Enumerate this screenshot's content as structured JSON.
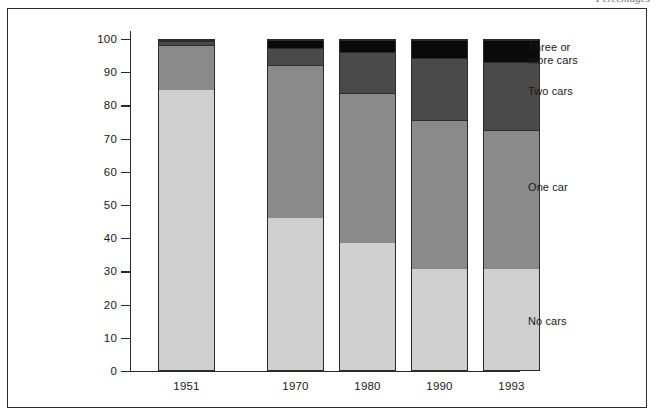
{
  "caption_fragment": "Percentages",
  "chart_data": {
    "type": "bar",
    "subtype": "stacked-bar-100",
    "title": "",
    "subtitle": "",
    "xlabel": "",
    "ylabel": "",
    "ylim": [
      0,
      100
    ],
    "yticks": [
      0,
      10,
      20,
      30,
      40,
      50,
      60,
      70,
      80,
      90,
      100
    ],
    "ytick_labels": [
      "0",
      "10",
      "20",
      "30",
      "40",
      "50",
      "60",
      "70",
      "80",
      "90",
      "100"
    ],
    "grid": false,
    "legend_position": "right",
    "categories": [
      "1951",
      "1970",
      "1980",
      "1990",
      "1993"
    ],
    "series": [
      {
        "name": "No cars",
        "color": "#cfcfcf",
        "values": [
          85,
          46.5,
          39,
          31,
          31
        ]
      },
      {
        "name": "One car",
        "color": "#8a8a8a",
        "values": [
          13.5,
          46,
          45,
          45,
          42
        ]
      },
      {
        "name": "Two cars",
        "color": "#4a4a4a",
        "values": [
          1.3,
          5,
          12.5,
          18.5,
          20.5
        ]
      },
      {
        "name": "Three or more cars",
        "color": "#0a0a0a",
        "values": [
          0.2,
          2.5,
          3.5,
          5.5,
          6.5
        ]
      }
    ],
    "legend_entries": [
      {
        "label": "Three or\nmore cars",
        "color": "#0a0a0a",
        "top": 18
      },
      {
        "label": "Two cars",
        "color": "#4a4a4a",
        "top": 62
      },
      {
        "label": "One car",
        "color": "#8a8a8a",
        "top": 158
      },
      {
        "label": "No cars",
        "color": "#cfcfcf",
        "top": 292
      }
    ]
  },
  "colors": {
    "frame": "#2b2b2b",
    "background": "#ffffff",
    "no_cars": "#cfcfcf",
    "one_car": "#8a8a8a",
    "two_cars": "#4a4a4a",
    "three_or_more_cars": "#0a0a0a"
  }
}
